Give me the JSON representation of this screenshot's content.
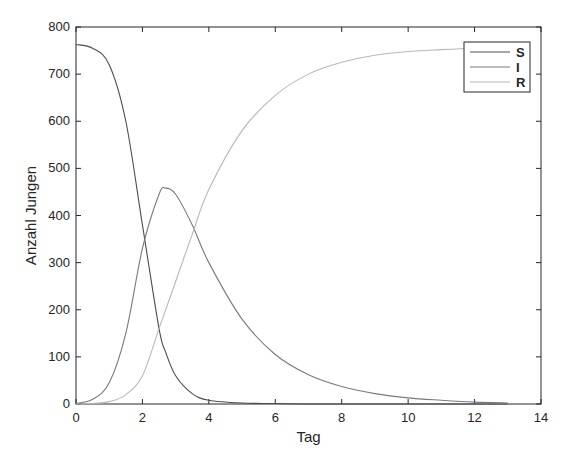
{
  "chart_data": {
    "type": "line",
    "title": "",
    "xlabel": "Tag",
    "ylabel": "Anzahl Jungen",
    "xlim": [
      0,
      14
    ],
    "ylim": [
      0,
      800
    ],
    "xticks": [
      0,
      2,
      4,
      6,
      8,
      10,
      12,
      14
    ],
    "yticks": [
      0,
      100,
      200,
      300,
      400,
      500,
      600,
      700,
      800
    ],
    "grid": false,
    "legend_position": "upper right",
    "x": [
      0,
      0.5,
      1,
      1.5,
      2,
      2.5,
      2.7,
      3,
      3.5,
      4,
      5,
      6,
      7,
      8,
      9,
      10,
      11,
      12,
      13
    ],
    "series": [
      {
        "name": "S",
        "color": "#4d4d4d",
        "values": [
          763,
          755,
          720,
          600,
          380,
          160,
          110,
          60,
          22,
          8,
          2,
          1,
          0,
          0,
          0,
          0,
          0,
          0,
          0
        ]
      },
      {
        "name": "I",
        "color": "#7a7a7a",
        "values": [
          1,
          10,
          45,
          150,
          330,
          445,
          458,
          445,
          380,
          300,
          180,
          105,
          62,
          37,
          22,
          13,
          8,
          4,
          2
        ]
      },
      {
        "name": "R",
        "color": "#b8b8b8",
        "values": [
          0,
          1,
          5,
          20,
          60,
          160,
          200,
          260,
          360,
          455,
          580,
          655,
          700,
          725,
          740,
          748,
          752,
          755,
          756
        ]
      }
    ]
  },
  "legend": {
    "s": "S",
    "i": "I",
    "r": "R"
  },
  "axis": {
    "xlabel": "Tag",
    "ylabel": "Anzahl Jungen",
    "xticks": [
      "0",
      "2",
      "4",
      "6",
      "8",
      "10",
      "12",
      "14"
    ],
    "yticks": [
      "0",
      "100",
      "200",
      "300",
      "400",
      "500",
      "600",
      "700",
      "800"
    ]
  }
}
